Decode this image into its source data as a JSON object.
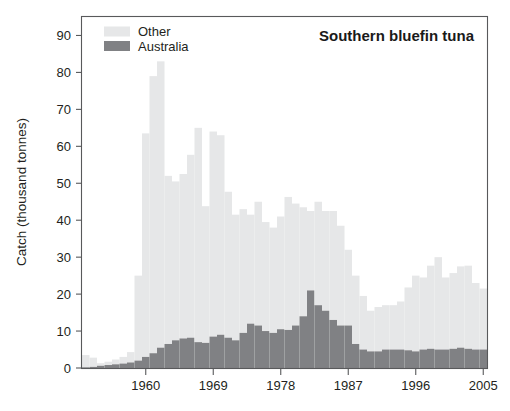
{
  "chart_data": {
    "type": "bar",
    "subtype": "stacked-vertical-bar",
    "title": "Southern bluefin tuna",
    "xlabel": "",
    "ylabel": "Catch (thousand tonnes)",
    "ylim": [
      0,
      95
    ],
    "yticks": [
      0,
      10,
      20,
      30,
      40,
      50,
      60,
      70,
      80,
      90
    ],
    "ytick_labels": [
      "0",
      "10",
      "20",
      "30",
      "40",
      "50",
      "60",
      "70",
      "80",
      "90"
    ],
    "xlim": [
      1951.5,
      2005.5
    ],
    "xticks": [
      1960,
      1969,
      1978,
      1987,
      1996,
      2005
    ],
    "xtick_labels": [
      "1960",
      "1969",
      "1978",
      "1987",
      "1996",
      "2005"
    ],
    "grid": false,
    "legend_position": "top-left",
    "legend": [
      "Other",
      "Australia"
    ],
    "colors": {
      "other": "#e6e7e8",
      "australia": "#808184",
      "axis": "#58595b",
      "text": "#231f20",
      "background": "#ffffff"
    },
    "x": [
      1952,
      1953,
      1954,
      1955,
      1956,
      1957,
      1958,
      1959,
      1960,
      1961,
      1962,
      1963,
      1964,
      1965,
      1966,
      1967,
      1968,
      1969,
      1970,
      1971,
      1972,
      1973,
      1974,
      1975,
      1976,
      1977,
      1978,
      1979,
      1980,
      1981,
      1982,
      1983,
      1984,
      1985,
      1986,
      1987,
      1988,
      1989,
      1990,
      1991,
      1992,
      1993,
      1994,
      1995,
      1996,
      1997,
      1998,
      1999,
      2000,
      2001,
      2002,
      2003,
      2004,
      2005
    ],
    "series": [
      {
        "name": "Australia",
        "color": "#808184",
        "values": [
          0.2,
          0.3,
          0.6,
          0.8,
          1.0,
          1.2,
          1.5,
          2.0,
          3.0,
          4.0,
          5.5,
          6.5,
          7.5,
          8.0,
          8.2,
          7.0,
          6.8,
          8.5,
          9.0,
          8.2,
          7.5,
          9.5,
          12.0,
          11.5,
          10.0,
          9.5,
          10.5,
          10.3,
          11.5,
          14.0,
          21.0,
          17.0,
          15.5,
          13.0,
          11.5,
          11.5,
          6.5,
          5.0,
          4.5,
          4.5,
          5.0,
          5.0,
          5.0,
          4.8,
          4.5,
          5.0,
          5.2,
          5.0,
          5.0,
          5.2,
          5.5,
          5.2,
          5.0,
          5.0
        ]
      },
      {
        "name": "Other",
        "color": "#e6e7e8",
        "values": [
          3.3,
          2.5,
          0.7,
          0.9,
          1.3,
          1.8,
          2.8,
          23.0,
          60.5,
          75.0,
          77.5,
          45.5,
          43.0,
          44.5,
          49.5,
          58.0,
          37.0,
          55.5,
          54.0,
          39.5,
          34.0,
          33.5,
          29.5,
          33.5,
          29.5,
          28.5,
          30.5,
          36.0,
          33.0,
          29.5,
          21.5,
          28.0,
          27.0,
          29.5,
          27.0,
          20.5,
          18.5,
          14.5,
          11.0,
          12.0,
          12.0,
          12.0,
          13.0,
          17.0,
          20.5,
          19.5,
          22.5,
          25.0,
          19.5,
          20.5,
          22.0,
          22.5,
          18.0,
          16.5
        ]
      }
    ],
    "totals": [
      3.5,
      2.8,
      1.3,
      1.7,
      2.3,
      3.0,
      4.3,
      25.0,
      63.5,
      79.0,
      83.0,
      52.0,
      50.5,
      52.5,
      57.7,
      65.0,
      43.8,
      64.0,
      63.0,
      47.7,
      41.5,
      43.0,
      41.5,
      45.0,
      39.5,
      38.0,
      41.0,
      46.3,
      44.5,
      43.5,
      42.5,
      45.0,
      42.5,
      42.5,
      38.5,
      32.0,
      25.0,
      19.5,
      15.5,
      16.5,
      17.0,
      17.0,
      18.0,
      21.8,
      25.0,
      24.5,
      27.7,
      30.0,
      24.5,
      25.7,
      27.5,
      27.7,
      23.0,
      21.5
    ]
  }
}
